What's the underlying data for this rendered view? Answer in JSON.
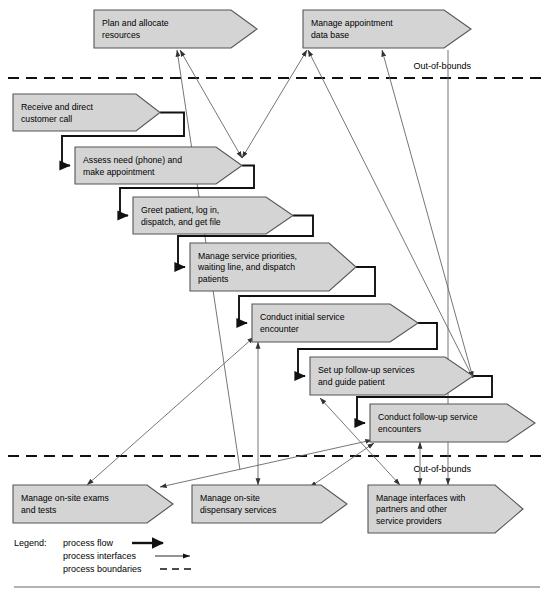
{
  "diagram": {
    "canvas": {
      "width": 553,
      "height": 595
    },
    "colors": {
      "chevron_fill": "#d4d4d4",
      "chevron_stroke": "#555555",
      "flow_stroke": "#111111",
      "interface_stroke": "#666666",
      "background": "#ffffff"
    }
  },
  "boundaries": [
    {
      "id": "boundary-top",
      "label": "Out-of-bounds",
      "y": 78,
      "x1": 8,
      "x2": 546,
      "label_x": 471,
      "label_y": 69
    },
    {
      "id": "boundary-bottom",
      "label": "Out-of-bounds",
      "y": 456,
      "x1": 8,
      "x2": 546,
      "label_x": 471,
      "label_y": 472
    }
  ],
  "processes": [
    {
      "id": "plan-and-allocate-resources",
      "lines": [
        "Plan and allocate",
        "resources"
      ],
      "x": 94,
      "y": 10,
      "w": 163,
      "h": 38,
      "tip": 26,
      "zone": "out-of-bounds-top"
    },
    {
      "id": "manage-appointment-data-base",
      "lines": [
        "Manage appointment",
        "data base"
      ],
      "x": 303,
      "y": 10,
      "w": 168,
      "h": 38,
      "tip": 27,
      "zone": "out-of-bounds-top"
    },
    {
      "id": "receive-and-direct-customer-call",
      "lines": [
        "Receive and direct",
        "customer call"
      ],
      "x": 13,
      "y": 94,
      "w": 147,
      "h": 37,
      "tip": 24,
      "zone": "in-bounds"
    },
    {
      "id": "assess-need-and-make-appointment",
      "lines": [
        "Assess need (phone) and",
        "make appointment"
      ],
      "x": 75,
      "y": 147,
      "w": 167,
      "h": 37,
      "tip": 26,
      "zone": "in-bounds"
    },
    {
      "id": "greet-patient-log-in-dispatch-get-file",
      "lines": [
        "Greet patient, log in,",
        "dispatch, and get file"
      ],
      "x": 133,
      "y": 197,
      "w": 160,
      "h": 37,
      "tip": 27,
      "zone": "in-bounds"
    },
    {
      "id": "manage-service-priorities-waiting-line-dispatch",
      "lines": [
        "Manage service priorities,",
        "waiting line, and dispatch",
        "patients"
      ],
      "x": 190,
      "y": 243,
      "w": 166,
      "h": 48,
      "tip": 27,
      "zone": "in-bounds"
    },
    {
      "id": "conduct-initial-service-encounter",
      "lines": [
        "Conduct initial service",
        "encounter"
      ],
      "x": 252,
      "y": 304,
      "w": 166,
      "h": 38,
      "tip": 28,
      "zone": "in-bounds"
    },
    {
      "id": "set-up-follow-up-services-and-guide-patient",
      "lines": [
        "Set up follow-up services",
        "and guide patient"
      ],
      "x": 310,
      "y": 357,
      "w": 163,
      "h": 38,
      "tip": 28,
      "zone": "in-bounds"
    },
    {
      "id": "conduct-follow-up-service-encounters",
      "lines": [
        "Conduct follow-up service",
        "encounters"
      ],
      "x": 370,
      "y": 404,
      "w": 165,
      "h": 38,
      "tip": 28,
      "zone": "in-bounds"
    },
    {
      "id": "manage-on-site-exams-and-tests",
      "lines": [
        "Manage on-site exams",
        "and tests"
      ],
      "x": 13,
      "y": 485,
      "w": 160,
      "h": 38,
      "tip": 26,
      "zone": "out-of-bounds-bottom"
    },
    {
      "id": "manage-on-site-dispensary-services",
      "lines": [
        "Manage on-site",
        "dispensary services"
      ],
      "x": 192,
      "y": 485,
      "w": 155,
      "h": 38,
      "tip": 26,
      "zone": "out-of-bounds-bottom"
    },
    {
      "id": "manage-interfaces-with-partners",
      "lines": [
        "Manage interfaces with",
        "partners and other",
        "service providers"
      ],
      "x": 368,
      "y": 485,
      "w": 155,
      "h": 48,
      "tip": 28,
      "zone": "out-of-bounds-bottom"
    }
  ],
  "process_flows": [
    {
      "id": "flow-receive-to-assess",
      "from": "receive-and-direct-customer-call",
      "to": "assess-need-and-make-appointment",
      "path": "M 160 112.5 L 184 112.5 L 184 136 L 62 136 L 62 165.5 L 70 165.5"
    },
    {
      "id": "flow-assess-to-greet",
      "from": "assess-need-and-make-appointment",
      "to": "greet-patient-log-in-dispatch-get-file",
      "path": "M 242 165.5 L 254 165.5 L 254 188 L 120 188 L 120 215.5 L 128 215.5"
    },
    {
      "id": "flow-greet-to-manage-priorities",
      "from": "greet-patient-log-in-dispatch-get-file",
      "to": "manage-service-priorities-waiting-line-dispatch",
      "path": "M 293 215.5 L 313 215.5 L 313 236 L 178 236 L 178 267 L 185 267"
    },
    {
      "id": "flow-priorities-to-initial-encounter",
      "from": "manage-service-priorities-waiting-line-dispatch",
      "to": "conduct-initial-service-encounter",
      "path": "M 356 267 L 375 267 L 375 296 L 239 296 L 239 323 L 247 323"
    },
    {
      "id": "flow-initial-to-set-up-follow-up",
      "from": "conduct-initial-service-encounter",
      "to": "set-up-follow-up-services-and-guide-patient",
      "path": "M 418 323 L 437 323 L 437 349 L 298 349 L 298 376 L 305 376"
    },
    {
      "id": "flow-set-up-to-conduct-follow-up",
      "from": "set-up-follow-up-services-and-guide-patient",
      "to": "conduct-follow-up-service-encounters",
      "path": "M 473 376 L 492 376 L 492 397 L 357 397 L 357 423 L 365 423"
    }
  ],
  "process_interfaces": [
    {
      "id": "iface-exams-to-plan",
      "from": "manage-on-site-exams-and-tests",
      "to": "plan-and-allocate-resources",
      "x1": 240,
      "y1": 470,
      "x2": 177,
      "y2": 50,
      "arrow_start": false,
      "arrow_end": true
    },
    {
      "id": "iface-dispensary-to-plan",
      "from": "manage-on-site-dispensary-services",
      "to": "plan-and-allocate-resources",
      "x1": 242,
      "y1": 158,
      "x2": 180,
      "y2": 50,
      "arrow_start": true,
      "arrow_end": true
    },
    {
      "id": "iface-assess-to-appointment-db",
      "from": "assess-need-and-make-appointment",
      "to": "manage-appointment-data-base",
      "x1": 242,
      "y1": 158,
      "x2": 307,
      "y2": 50,
      "arrow_start": true,
      "arrow_end": true
    },
    {
      "id": "iface-followup-to-appointment-db",
      "from": "set-up-follow-up-services-and-guide-patient",
      "to": "manage-appointment-data-base",
      "x1": 473,
      "y1": 378,
      "x2": 308,
      "y2": 50,
      "arrow_start": true,
      "arrow_end": true
    },
    {
      "id": "iface-followup-to-appointment-db-right",
      "from": "set-up-follow-up-services-and-guide-patient",
      "to": "manage-appointment-data-base",
      "x1": 473,
      "y1": 378,
      "x2": 382,
      "y2": 50,
      "arrow_start": true,
      "arrow_end": true
    },
    {
      "id": "iface-initial-encounter-to-dispensary",
      "from": "conduct-initial-service-encounter",
      "to": "manage-on-site-dispensary-services",
      "x1": 258,
      "y1": 342,
      "x2": 258,
      "y2": 485,
      "arrow_start": true,
      "arrow_end": true
    },
    {
      "id": "iface-initial-encounter-to-exams",
      "from": "conduct-initial-service-encounter",
      "to": "manage-on-site-exams-and-tests",
      "x1": 254,
      "y1": 337,
      "x2": 87,
      "y2": 485,
      "arrow_start": true,
      "arrow_end": true
    },
    {
      "id": "iface-followup-encounters-to-exams",
      "from": "conduct-follow-up-service-encounters",
      "to": "manage-on-site-exams-and-tests",
      "x1": 372,
      "y1": 440,
      "x2": 160,
      "y2": 487,
      "arrow_start": true,
      "arrow_end": true
    },
    {
      "id": "iface-setup-to-interfaces-partners",
      "from": "set-up-follow-up-services-and-guide-patient",
      "to": "manage-interfaces-with-partners",
      "x1": 320,
      "y1": 398,
      "x2": 400,
      "y2": 485,
      "arrow_start": true,
      "arrow_end": true
    },
    {
      "id": "iface-followup-encounters-to-dispensary",
      "from": "conduct-follow-up-service-encounters",
      "to": "manage-on-site-dispensary-services",
      "x1": 374,
      "y1": 443,
      "x2": 310,
      "y2": 487,
      "arrow_start": true,
      "arrow_end": true
    },
    {
      "id": "iface-followup-encounters-to-partners",
      "from": "conduct-follow-up-service-encounters",
      "to": "manage-interfaces-with-partners",
      "x1": 420,
      "y1": 442,
      "x2": 420,
      "y2": 485,
      "arrow_start": true,
      "arrow_end": true
    },
    {
      "id": "iface-appointment-db-to-partners",
      "from": "manage-appointment-data-base",
      "to": "manage-interfaces-with-partners",
      "x1": 448,
      "y1": 50,
      "x2": 448,
      "y2": 485,
      "arrow_start": false,
      "arrow_end": true
    }
  ],
  "legend": {
    "title": "Legend:",
    "title_x": 14,
    "title_y": 546,
    "items": [
      {
        "id": "legend-process-flow",
        "label": "process flow",
        "kind": "flow",
        "label_x": 63,
        "label_y": 546,
        "line_x1": 132,
        "line_x2": 163,
        "line_y": 543
      },
      {
        "id": "legend-process-interfaces",
        "label": "process interfaces",
        "kind": "interface",
        "label_x": 63,
        "label_y": 559,
        "line_x1": 155,
        "line_x2": 190,
        "line_y": 556
      },
      {
        "id": "legend-process-boundaries",
        "label": "process boundaries",
        "kind": "boundary",
        "label_x": 63,
        "label_y": 572,
        "line_x1": 160,
        "line_x2": 195,
        "line_y": 569
      }
    ]
  },
  "footer_rule": {
    "id": "footer-rule",
    "x1": 14,
    "x2": 540,
    "y": 587
  }
}
